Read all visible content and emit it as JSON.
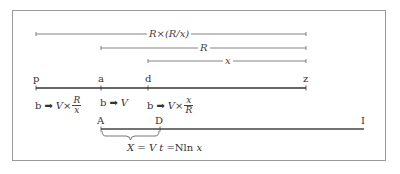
{
  "diagram": {
    "measures": [
      {
        "label": "R×(R/x)",
        "from": "p",
        "to": "z"
      },
      {
        "label": "R",
        "from": "a",
        "to": "z"
      },
      {
        "label": "x",
        "from": "d",
        "to": "z"
      }
    ],
    "axis_points": [
      "p",
      "a",
      "d",
      "z"
    ],
    "transforms": [
      {
        "prefix": "b",
        "arrow": "→",
        "expr": "V×",
        "frac_num": "R",
        "frac_den": "x"
      },
      {
        "prefix": "b",
        "arrow": "→",
        "expr": "V"
      },
      {
        "prefix": "b",
        "arrow": "→",
        "expr": "V×",
        "frac_num": "x",
        "frac_den": "R"
      }
    ],
    "lower_points": [
      "A",
      "D",
      "I"
    ],
    "brace_formula": {
      "lhs": "X",
      "eq1": " = ",
      "mid": "V t",
      "eq2": " =",
      "rhs_upright": "Nln ",
      "rhs_var": "x"
    }
  },
  "colors": {
    "frame": "#9a9a9a",
    "line": "#555555",
    "thick_line": "#444444"
  }
}
